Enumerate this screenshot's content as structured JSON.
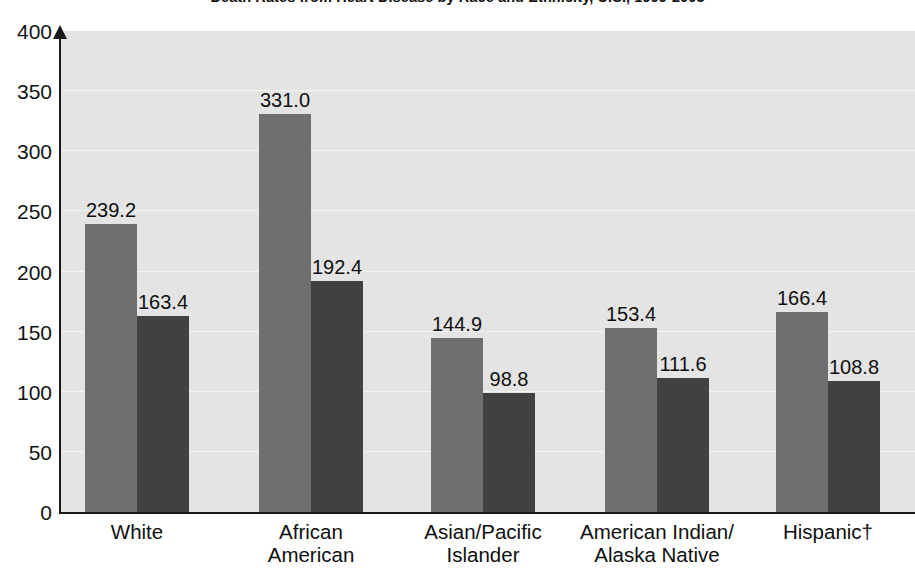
{
  "chart_data": {
    "type": "bar",
    "title": "Death Rates from Heart Disease by Race and Ethnicity, U.S., 1999-2003",
    "xlabel": "",
    "ylabel": "",
    "ylim": [
      0,
      400
    ],
    "ytick_values": [
      0,
      50,
      100,
      150,
      200,
      250,
      300,
      350,
      400
    ],
    "ytick_labels": [
      "0",
      "50",
      "100",
      "150",
      "200",
      "250",
      "300",
      "350",
      "400"
    ],
    "grid": true,
    "legend_position": "none",
    "categories": [
      "White",
      "African\nAmerican",
      "Asian/Pacific\nIslander",
      "American Indian/\nAlaska Native",
      "Hispanic†"
    ],
    "series": [
      {
        "name": "series-1",
        "color": "#6f6f6f",
        "values": [
          239.2,
          331.0,
          144.9,
          153.4,
          166.4
        ],
        "labels": [
          "239.2",
          "331.0",
          "144.9",
          "153.4",
          "166.4"
        ]
      },
      {
        "name": "series-2",
        "color": "#414141",
        "values": [
          163.4,
          192.4,
          98.8,
          111.6,
          108.8
        ],
        "labels": [
          "163.4",
          "192.4",
          "98.8",
          "111.6",
          "108.8"
        ]
      }
    ],
    "footnote_marker": "†",
    "plot_background": "#e4e4e4",
    "gridline_color": "#f4f4f4",
    "axis_color": "#1a1a1a"
  }
}
